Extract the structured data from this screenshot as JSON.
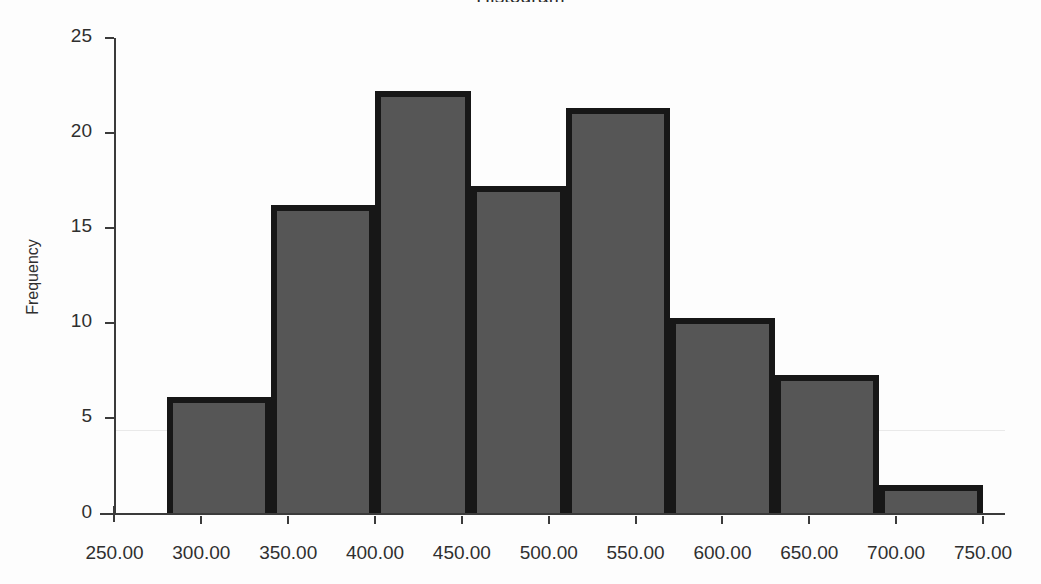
{
  "chart_data": {
    "type": "bar",
    "title": "Histogram",
    "xlabel": "",
    "ylabel": "Frequency",
    "ylim": [
      0,
      25
    ],
    "xlim": [
      250,
      750
    ],
    "grid": true,
    "legend": null,
    "bin_width": 50,
    "bin_edges": [
      280,
      340,
      400,
      455,
      510,
      570,
      630,
      690,
      750
    ],
    "categories": [
      "280-340",
      "340-400",
      "400-455",
      "455-510",
      "510-570",
      "570-630",
      "630-690",
      "690-750"
    ],
    "values": [
      6.1,
      16.2,
      22.2,
      17.2,
      21.3,
      10.3,
      7.3,
      1.5
    ],
    "bars": [
      {
        "label": "bin-1",
        "x0": 280,
        "x1": 340,
        "value": 6.1
      },
      {
        "label": "bin-2",
        "x0": 340,
        "x1": 400,
        "value": 16.2
      },
      {
        "label": "bin-3",
        "x0": 400,
        "x1": 455,
        "value": 22.2
      },
      {
        "label": "bin-4",
        "x0": 455,
        "x1": 510,
        "value": 17.2
      },
      {
        "label": "bin-5",
        "x0": 510,
        "x1": 570,
        "value": 21.3
      },
      {
        "label": "bin-6",
        "x0": 570,
        "x1": 630,
        "value": 10.3
      },
      {
        "label": "bin-7",
        "x0": 630,
        "x1": 690,
        "value": 7.3
      },
      {
        "label": "bin-8",
        "x0": 690,
        "x1": 750,
        "value": 1.5
      }
    ],
    "y_ticks": [
      0,
      5,
      10,
      15,
      20,
      25
    ],
    "y_tick_labels": [
      "0",
      "5",
      "10",
      "15",
      "20",
      "25"
    ],
    "x_ticks": [
      250,
      300,
      350,
      400,
      450,
      500,
      550,
      600,
      650,
      700,
      750
    ],
    "x_tick_labels": [
      "250.00",
      "300.00",
      "350.00",
      "400.00",
      "450.00",
      "500.00",
      "550.00",
      "600.00",
      "650.00",
      "700.00",
      "750.00"
    ],
    "gridline_values": [
      4.4
    ],
    "colors": {
      "bar_fill": "#565656",
      "bar_border": "#171717",
      "axis": "#3b3b3b",
      "text": "#2f2f2f",
      "gridline": "#e1e1e1",
      "background": "#fdfdfd"
    }
  }
}
